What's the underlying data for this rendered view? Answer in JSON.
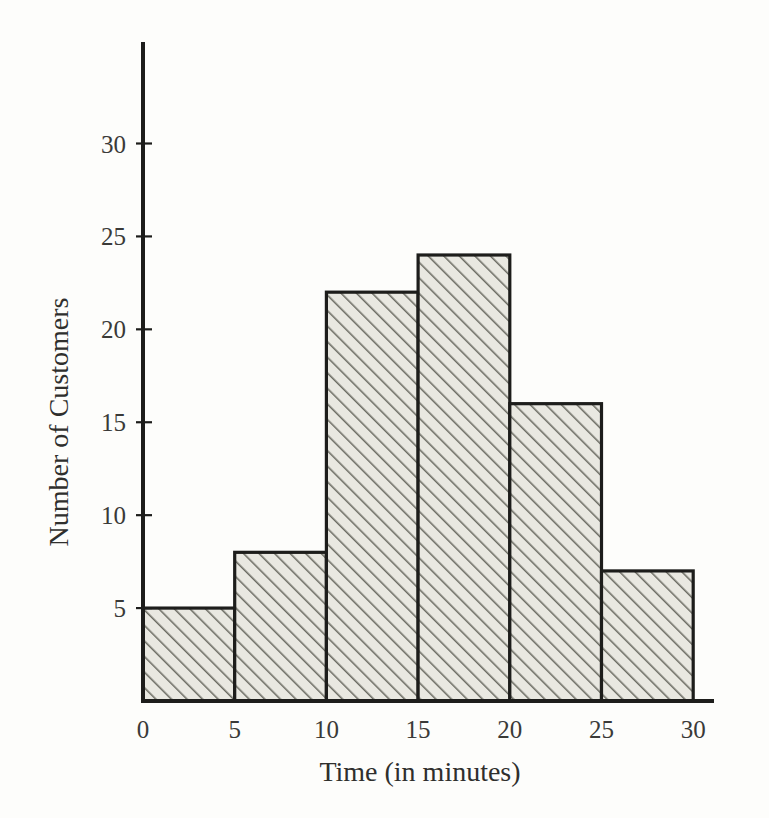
{
  "figure": {
    "background_color": "#fdfdfb",
    "ink_color": "#1d1d1b",
    "bar_fill_color": "#e8e7e0",
    "hatch_color": "#6e6e66"
  },
  "chart_data": {
    "type": "bar",
    "title": "",
    "subtitle": "",
    "xlabel": "Time (in minutes)",
    "ylabel": "Number of Customers",
    "categories": [
      "0-5",
      "5-10",
      "10-15",
      "15-20",
      "20-25",
      "25-30"
    ],
    "bin_edges": [
      0,
      5,
      10,
      15,
      20,
      25,
      30
    ],
    "values": [
      5,
      8,
      22,
      24,
      16,
      7
    ],
    "x_tick_labels": [
      "0",
      "5",
      "10",
      "15",
      "20",
      "25",
      "30"
    ],
    "x_tick_values": [
      0,
      5,
      10,
      15,
      20,
      25,
      30
    ],
    "y_tick_labels": [
      "5",
      "10",
      "15",
      "20",
      "25",
      "30"
    ],
    "y_tick_values": [
      5,
      10,
      15,
      20,
      25,
      30
    ],
    "xlim": [
      0,
      30
    ],
    "ylim": [
      0,
      30
    ],
    "grid": false,
    "legend": false,
    "legend_position": "none",
    "bar_style": "diagonal-hatch",
    "annotations": []
  }
}
